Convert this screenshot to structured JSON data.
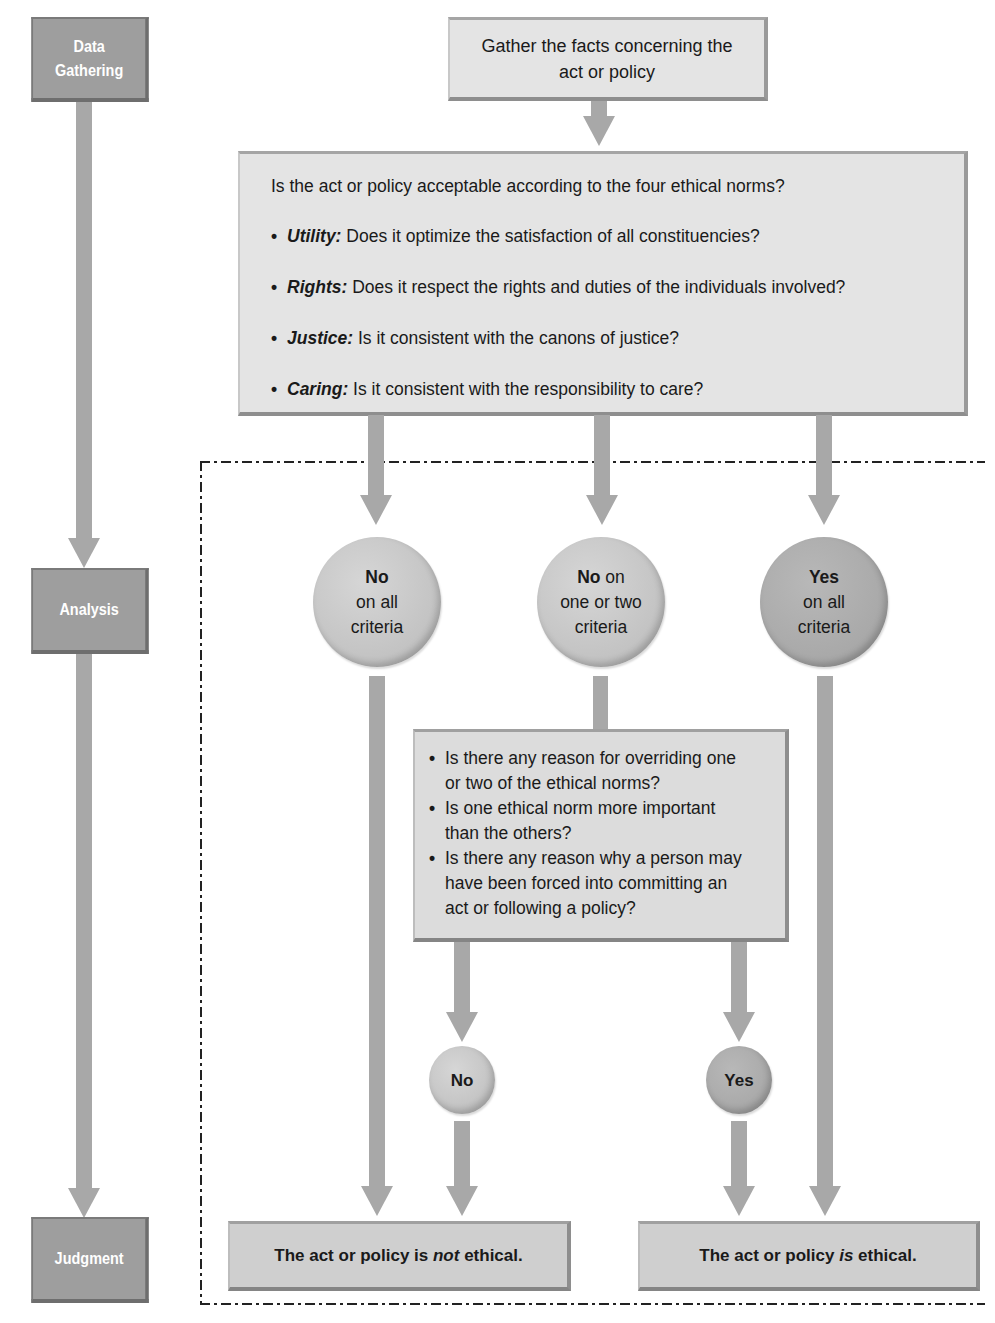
{
  "stages": {
    "data_gathering_line1": "Data",
    "data_gathering_line2": "Gathering",
    "analysis": "Analysis",
    "judgment": "Judgment"
  },
  "gather_box": {
    "line1": "Gather the facts concerning the",
    "line2": "act or policy"
  },
  "norms_box": {
    "question": "Is the act or policy acceptable according to the four ethical norms?",
    "norms": [
      {
        "name": "Utility:",
        "text": " Does it optimize the satisfaction of all constituencies?"
      },
      {
        "name": "Rights:",
        "text": " Does it respect the rights and duties of the individuals involved?"
      },
      {
        "name": "Justice:",
        "text": " Is it consistent with the canons of justice?"
      },
      {
        "name": "Caring:",
        "text": " Is it consistent with the responsibility to care?"
      }
    ],
    "bullet": "•"
  },
  "outcomes": {
    "no_all": {
      "bold": "No",
      "line2": "on all",
      "line3": "criteria"
    },
    "no_some": {
      "bold": "No",
      "bold_suffix": " on",
      "line2": "one or two",
      "line3": "criteria"
    },
    "yes_all": {
      "bold": "Yes",
      "line2": "on all",
      "line3": "criteria"
    }
  },
  "override_box": {
    "bullet": "•",
    "items": [
      {
        "line1": "Is there any reason for overriding one",
        "line2": "or two of the ethical norms?"
      },
      {
        "line1": "Is one ethical norm more important",
        "line2": "than the others?"
      },
      {
        "line1": "Is there any reason why a person may",
        "line2": "have been forced into committing an",
        "line3": "act or following a policy?"
      }
    ]
  },
  "small_circles": {
    "no": "No",
    "yes": "Yes"
  },
  "results": {
    "not_ethical": {
      "prefix": "The act or policy is ",
      "emph": "not",
      "suffix": " ethical."
    },
    "is_ethical": {
      "prefix": "The act or policy ",
      "emph": "is",
      "suffix": " ethical."
    }
  },
  "colors": {
    "stage_fill": "#9e9e9e",
    "box_fill": "#e4e4e4",
    "arrow": "#a8a8a8",
    "dashed_border": "#222222"
  }
}
